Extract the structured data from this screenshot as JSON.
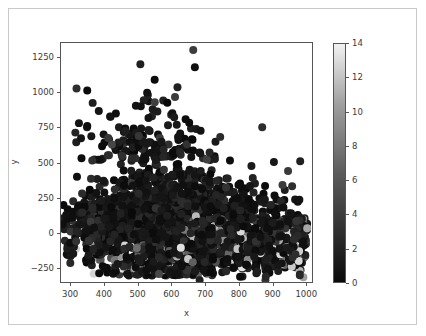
{
  "figure": {
    "background": "#ffffff",
    "frame_color": "#c9c9c9",
    "axes_edge_color": "#555555",
    "tick_color": "#3a3a3a"
  },
  "chart_data": {
    "type": "scatter",
    "title": "",
    "xlabel": "x",
    "ylabel": "y",
    "xlim": [
      270,
      1020
    ],
    "ylim": [
      -360,
      1360
    ],
    "xticks": [
      300,
      400,
      500,
      600,
      700,
      800,
      900,
      1000
    ],
    "xticklabels": [
      "300",
      "400",
      "500",
      "600",
      "700",
      "800",
      "900",
      "1000"
    ],
    "yticks": [
      -250,
      0,
      250,
      500,
      750,
      1000,
      1250
    ],
    "yticklabels": [
      "−250",
      "0",
      "250",
      "500",
      "750",
      "1000",
      "1250"
    ],
    "grid": false,
    "legend": null,
    "marker": "o",
    "marker_size": 4.2,
    "colormap": "gray",
    "color_by": "c",
    "n_points": 2600,
    "colorbar": {
      "vmin": 0,
      "vmax": 14,
      "ticks": [
        0,
        2,
        4,
        6,
        8,
        10,
        12,
        14
      ],
      "ticklabels": [
        "0",
        "2",
        "4",
        "6",
        "8",
        "10",
        "12",
        "14"
      ],
      "orientation": "vertical",
      "position": "right",
      "low_color": "#0a0a0a",
      "high_color": "#f2f2f2"
    },
    "notable_points": [
      {
        "x": 662,
        "y": 1310,
        "c": 3.0
      },
      {
        "x": 315,
        "y": -55,
        "c": 2.5
      },
      {
        "x": 352,
        "y": -52,
        "c": 2.5
      },
      {
        "x": 978,
        "y": -298,
        "c": 1.8
      },
      {
        "x": 548,
        "y": 938,
        "c": 3.2
      },
      {
        "x": 608,
        "y": 975,
        "c": 3.0
      },
      {
        "x": 742,
        "y": 690,
        "c": 2.0
      }
    ]
  }
}
